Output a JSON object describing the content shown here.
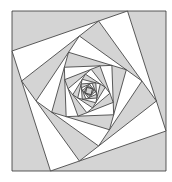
{
  "diagram": {
    "outer_square": [
      [
        12,
        11
      ],
      [
        166,
        11
      ],
      [
        166,
        171
      ],
      [
        12,
        171
      ]
    ],
    "fraction": 0.75,
    "levels": 14,
    "colors": {
      "gray": "#d4d4d4",
      "white": "#ffffff",
      "stroke": "#333333",
      "inner": "#d4d4d4"
    }
  }
}
